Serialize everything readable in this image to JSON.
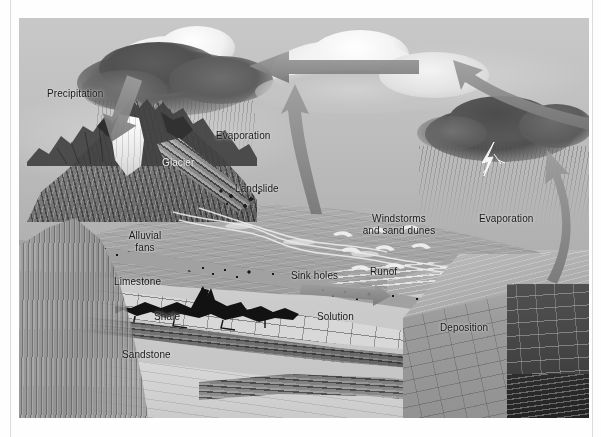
{
  "document": {
    "type": "illustration",
    "title": "Hydrologic and geologic cycle landscape cross-section diagram",
    "rendering": "grayscale halftone airbrush illustration",
    "plate": {
      "x": 19,
      "y": 18,
      "width": 570,
      "height": 400
    }
  },
  "labels": [
    {
      "id": "precipitation",
      "text": "Precipitation",
      "x": 28,
      "y": 70,
      "align": "left"
    },
    {
      "id": "evaporation-left",
      "text": "Evaporation",
      "x": 197,
      "y": 112,
      "align": "left"
    },
    {
      "id": "glacier",
      "text": "Glacier",
      "x": 143,
      "y": 139,
      "align": "left"
    },
    {
      "id": "landslide",
      "text": "Landslide",
      "x": 216,
      "y": 165,
      "align": "left"
    },
    {
      "id": "alluvial-fans",
      "text": "Alluvial\nfans",
      "x": 126,
      "y": 212,
      "align": "center"
    },
    {
      "id": "windstorms",
      "text": "Windstorms\nand sand dunes",
      "x": 380,
      "y": 195,
      "align": "center"
    },
    {
      "id": "evaporation-right",
      "text": "Evaporation",
      "x": 494,
      "y": 213,
      "align": "left"
    },
    {
      "id": "limestone",
      "text": "Limestone",
      "x": 114,
      "y": 272,
      "align": "left"
    },
    {
      "id": "sink-holes",
      "text": "Sink holes",
      "x": 291,
      "y": 266,
      "align": "left"
    },
    {
      "id": "runof",
      "text": "Runof",
      "x": 370,
      "y": 262,
      "align": "left"
    },
    {
      "id": "shale",
      "text": "Shale",
      "x": 154,
      "y": 307,
      "align": "left"
    },
    {
      "id": "solution",
      "text": "Solution",
      "x": 317,
      "y": 307,
      "align": "left"
    },
    {
      "id": "deposition",
      "text": "Deposition",
      "x": 440,
      "y": 318,
      "align": "left"
    },
    {
      "id": "sandstone",
      "text": "Sandstone",
      "x": 122,
      "y": 345,
      "align": "left"
    }
  ],
  "arrows": [
    {
      "id": "precipitation-arrow",
      "description": "thick arrow pointing down-right from dark cloud toward mountain peak",
      "direction": "down-right"
    },
    {
      "id": "moisture-transport-arrow",
      "description": "long horizontal arrow pointing left from central cumulus toward dark storm cloud",
      "direction": "left"
    },
    {
      "id": "evaporation-arrow-left",
      "description": "curved arrow rising from plain up to central cumulus cloud",
      "direction": "up"
    },
    {
      "id": "evaporation-arrow-right",
      "description": "curved arrow rising from sea surface up into the right storm cloud",
      "direction": "up"
    },
    {
      "id": "transport-arrow-right",
      "description": "curved arrow from right storm cloud sweeping left toward central cumulus",
      "direction": "up-left"
    },
    {
      "id": "runoff-arrow",
      "description": "short arrow pointing right along the ground toward the sea",
      "direction": "right"
    }
  ],
  "features": [
    {
      "id": "storm-cloud-left",
      "name": "dark storm cloud with rain"
    },
    {
      "id": "cumulus-center",
      "name": "white cumulus cloud"
    },
    {
      "id": "storm-cloud-right",
      "name": "dark storm cloud with rain and lightning"
    },
    {
      "id": "lightning-bolt",
      "name": "lightning bolt"
    },
    {
      "id": "mountain",
      "name": "glaciated mountain massif"
    },
    {
      "id": "glacier-ice",
      "name": "valley glacier"
    },
    {
      "id": "landslide-chute",
      "name": "landslide debris chute"
    },
    {
      "id": "alluvial-fan",
      "name": "alluvial fan deposits"
    },
    {
      "id": "sand-dunes",
      "name": "barchan sand dunes"
    },
    {
      "id": "river-runoff",
      "name": "braided river / runoff channel"
    },
    {
      "id": "sea",
      "name": "sea / standing water body"
    },
    {
      "id": "cavern",
      "name": "solution cavern in limestone"
    },
    {
      "id": "block-diagram",
      "name": "3D cutaway block of bedrock strata"
    }
  ],
  "strata": [
    {
      "id": "gravel",
      "name": "Alluvium / gravel",
      "pattern": "coarse dots"
    },
    {
      "id": "limestone",
      "name": "Limestone",
      "pattern": "brick"
    },
    {
      "id": "shale",
      "name": "Shale",
      "pattern": "wavy lines"
    },
    {
      "id": "sandstone",
      "name": "Sandstone",
      "pattern": "stipple"
    }
  ],
  "colors": {
    "plate_background": "#b9bbbd",
    "sky": "#c2c4c6",
    "label_text": "#16181a",
    "arrow": "#8a8c8f",
    "page_rule": "#dcdcdc",
    "page_background": "#ffffff"
  }
}
